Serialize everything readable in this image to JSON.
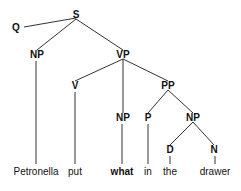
{
  "diagram": {
    "type": "syntax-tree",
    "nodes": [
      {
        "id": "S",
        "label": "S",
        "x": 76,
        "y": 15
      },
      {
        "id": "Q",
        "label": "Q",
        "x": 16,
        "y": 28
      },
      {
        "id": "NP1",
        "label": "NP",
        "x": 37,
        "y": 55
      },
      {
        "id": "VP",
        "label": "VP",
        "x": 123,
        "y": 55
      },
      {
        "id": "V",
        "label": "V",
        "x": 75,
        "y": 86
      },
      {
        "id": "NP2",
        "label": "NP",
        "x": 123,
        "y": 118
      },
      {
        "id": "PP",
        "label": "PP",
        "x": 168,
        "y": 86
      },
      {
        "id": "P",
        "label": "P",
        "x": 148,
        "y": 118
      },
      {
        "id": "NP3",
        "label": "NP",
        "x": 193,
        "y": 118
      },
      {
        "id": "D",
        "label": "D",
        "x": 170,
        "y": 150
      },
      {
        "id": "N",
        "label": "N",
        "x": 214,
        "y": 150
      }
    ],
    "leaves": [
      {
        "id": "w1",
        "text": "Petronella",
        "x": 36,
        "parent": "NP1",
        "bold": false
      },
      {
        "id": "w2",
        "text": "put",
        "x": 75,
        "parent": "V",
        "bold": false
      },
      {
        "id": "w3",
        "text": "what",
        "x": 122,
        "parent": "NP2",
        "bold": true
      },
      {
        "id": "w4",
        "text": "in",
        "x": 148,
        "parent": "P",
        "bold": false
      },
      {
        "id": "w5",
        "text": "the",
        "x": 170,
        "parent": "D",
        "bold": false
      },
      {
        "id": "w6",
        "text": "drawer",
        "x": 215,
        "parent": "N",
        "bold": false
      }
    ],
    "edges": [
      [
        "S",
        "Q"
      ],
      [
        "S",
        "NP1"
      ],
      [
        "S",
        "VP"
      ],
      [
        "VP",
        "V"
      ],
      [
        "VP",
        "NP2"
      ],
      [
        "VP",
        "PP"
      ],
      [
        "PP",
        "P"
      ],
      [
        "PP",
        "NP3"
      ],
      [
        "NP3",
        "D"
      ],
      [
        "NP3",
        "N"
      ]
    ],
    "leaf_baseline_y": 175
  }
}
